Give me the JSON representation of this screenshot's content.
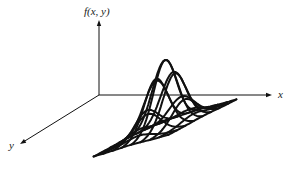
{
  "diagram": {
    "title": "",
    "axes": {
      "vertical_label": "f(x, y)",
      "x_label": "x",
      "y_label": "y"
    },
    "colors": {
      "background": "#ffffff",
      "ink": "#111111"
    },
    "geometry": {
      "origin": [
        99,
        95
      ],
      "vertical_axis_end": [
        99,
        20
      ],
      "x_axis_end": [
        272,
        95
      ],
      "y_axis_end": [
        20,
        144
      ],
      "surface_center": [
        165,
        128
      ],
      "peak_height": 68,
      "x_unit": [
        11,
        -3.2
      ],
      "y_unit": [
        -10,
        5.2
      ],
      "grid_range": [
        -3.4,
        3.4
      ],
      "grid_lines": 9,
      "sigma": 1.15
    }
  }
}
